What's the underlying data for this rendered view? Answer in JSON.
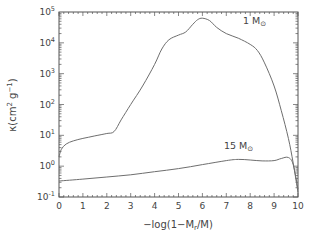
{
  "chart_data": {
    "type": "line",
    "title": "",
    "xlabel": "-log(1-M_r/M)",
    "ylabel": "κ(cm² g⁻¹)",
    "xlim": [
      0,
      10
    ],
    "ylim_log10": [
      -1,
      5
    ],
    "yscale": "log",
    "grid": false,
    "legend": "none (inline annotations)",
    "x_ticks": [
      "0",
      "1",
      "2",
      "3",
      "4",
      "5",
      "6",
      "7",
      "8",
      "9",
      "10"
    ],
    "y_ticks": [
      {
        "base": "10",
        "exp": "5",
        "value": 100000
      },
      {
        "base": "10",
        "exp": "4",
        "value": 10000
      },
      {
        "base": "10",
        "exp": "3",
        "value": 1000
      },
      {
        "base": "10",
        "exp": "2",
        "value": 100
      },
      {
        "base": "10",
        "exp": "1",
        "value": 10
      },
      {
        "base": "10",
        "exp": "0",
        "value": 1
      },
      {
        "base": "10",
        "exp": "-1",
        "value": 0.1
      }
    ],
    "series": [
      {
        "name": "1 M☉",
        "x": [
          0.0,
          0.1,
          0.3,
          0.6,
          1.0,
          1.5,
          2.0,
          2.3,
          2.6,
          3.0,
          3.5,
          4.0,
          4.3,
          4.6,
          5.0,
          5.3,
          5.6,
          5.8,
          6.0,
          6.3,
          6.6,
          7.0,
          7.5,
          8.0,
          8.3,
          8.6,
          9.0,
          9.3,
          9.6,
          9.8,
          10.0
        ],
        "log10_y": [
          0.3,
          0.55,
          0.72,
          0.82,
          0.9,
          0.98,
          1.06,
          1.12,
          1.5,
          2.0,
          2.6,
          3.3,
          3.8,
          4.1,
          4.25,
          4.35,
          4.6,
          4.75,
          4.8,
          4.72,
          4.5,
          4.3,
          4.15,
          3.95,
          3.75,
          3.35,
          2.6,
          1.8,
          0.9,
          0.1,
          -0.85
        ]
      },
      {
        "name": "15 M☉",
        "x": [
          0.0,
          1.0,
          2.0,
          3.0,
          4.0,
          5.0,
          6.0,
          7.0,
          7.5,
          8.0,
          8.5,
          9.0,
          9.3,
          9.6,
          9.8,
          10.0
        ],
        "log10_y": [
          -0.48,
          -0.42,
          -0.35,
          -0.28,
          -0.18,
          -0.08,
          0.05,
          0.18,
          0.22,
          0.2,
          0.17,
          0.18,
          0.25,
          0.28,
          0.05,
          -0.75
        ]
      }
    ],
    "annotations": [
      {
        "text": "1 M",
        "sub": "⊙",
        "near_series": "1 M☉",
        "x": 7.7,
        "log10_y": 4.6
      },
      {
        "text": "15 M",
        "sub": "⊙",
        "near_series": "15 M☉",
        "x": 6.9,
        "log10_y": 0.55
      }
    ]
  },
  "labels": {
    "xlabel": "−log(1−M",
    "xlabel_sub": "r",
    "xlabel_end": "/M)",
    "ylabel_main": "κ(cm",
    "ylabel_sup1": "2",
    "ylabel_mid": " g",
    "ylabel_sup2": "−1",
    "ylabel_end": ")"
  },
  "colors": {
    "line": "#6e6e6e",
    "axis": "#555555",
    "text": "#444444"
  }
}
